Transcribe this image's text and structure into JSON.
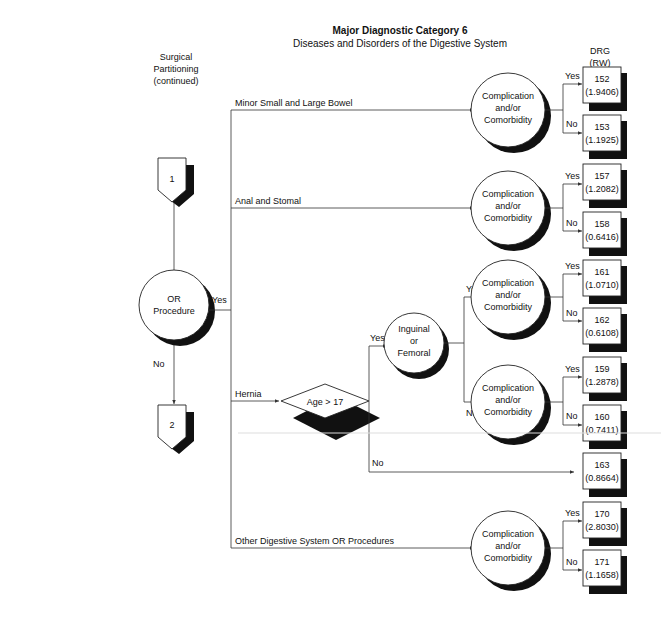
{
  "header": {
    "title": "Major Diagnostic Category 6",
    "subtitle": "Diseases and Disorders of the Digestive System"
  },
  "side_label": {
    "line1": "Surgical",
    "line2": "Partitioning",
    "line3": "(continued)"
  },
  "column_header": {
    "line1": "DRG",
    "line2": "(RW)"
  },
  "connectors": {
    "start": "1",
    "end": "2"
  },
  "decisions": {
    "or_procedure": {
      "line1": "OR",
      "line2": "Procedure",
      "yes": "Yes",
      "no": "No"
    },
    "age": {
      "label": "Age > 17",
      "yes": "Yes",
      "no": "No"
    },
    "inguinal": {
      "line1": "Inguinal",
      "line2": "or",
      "line3": "Femoral",
      "yes": "Yes",
      "no": "No"
    },
    "cc": {
      "line1": "Complication",
      "line2": "and/or",
      "line3": "Comorbidity",
      "yes": "Yes",
      "no": "No"
    }
  },
  "branches": {
    "minor_bowel": "Minor Small and Large Bowel",
    "anal_stomal": "Anal and Stomal",
    "hernia": "Hernia",
    "other": "Other Digestive System OR Procedures"
  },
  "drgs": [
    {
      "drg": "152",
      "rw": "(1.9406)"
    },
    {
      "drg": "153",
      "rw": "(1.1925)"
    },
    {
      "drg": "157",
      "rw": "(1.2082)"
    },
    {
      "drg": "158",
      "rw": "(0.6416)"
    },
    {
      "drg": "161",
      "rw": "(1.0710)"
    },
    {
      "drg": "162",
      "rw": "(0.6108)"
    },
    {
      "drg": "159",
      "rw": "(1.2878)"
    },
    {
      "drg": "160",
      "rw": "(0.7411)"
    },
    {
      "drg": "163",
      "rw": "(0.8664)"
    },
    {
      "drg": "170",
      "rw": "(2.8030)"
    },
    {
      "drg": "171",
      "rw": "(1.1658)"
    }
  ]
}
